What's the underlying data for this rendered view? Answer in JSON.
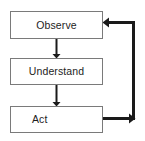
{
  "diagram": {
    "type": "flowchart",
    "background_color": "#ffffff",
    "box_border_color": "#7a7a7a",
    "connector_color": "#1a1a1a",
    "text_color": "#1d1d1d",
    "nodes": [
      {
        "id": "observe",
        "label": "Observe",
        "x": 10,
        "y": 11,
        "width": 93,
        "height": 28,
        "align": "center"
      },
      {
        "id": "understand",
        "label": "Understand",
        "x": 10,
        "y": 58,
        "width": 93,
        "height": 27,
        "align": "center"
      },
      {
        "id": "act",
        "label": "Act",
        "x": 10,
        "y": 106,
        "width": 93,
        "height": 27,
        "align": "left"
      }
    ],
    "connectors": [
      {
        "id": "observe-to-understand",
        "from": "observe",
        "to": "understand",
        "kind": "straight-down-arrow"
      },
      {
        "id": "understand-to-act",
        "from": "understand",
        "to": "act",
        "kind": "straight-down-arrow"
      },
      {
        "id": "act-to-observe-feedback",
        "from": "act",
        "to": "observe",
        "kind": "right-up-left-feedback-loop"
      }
    ]
  }
}
